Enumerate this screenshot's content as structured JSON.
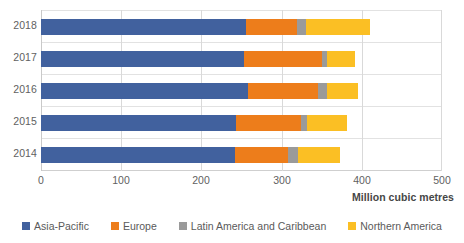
{
  "chart_data": {
    "type": "bar",
    "orientation": "horizontal",
    "stacked": true,
    "title": "",
    "subtitle": "",
    "xlabel": "Million cubic metres",
    "ylabel": "",
    "categories": [
      "2018",
      "2017",
      "2016",
      "2015",
      "2014"
    ],
    "xlim": [
      0,
      500
    ],
    "xticks": [
      "0",
      "100",
      "200",
      "300",
      "400",
      "500"
    ],
    "xtick_values": [
      0,
      100,
      200,
      300,
      400,
      500
    ],
    "grid": "vertical",
    "legend_position": "bottom",
    "series": [
      {
        "name": "Asia-Pacific",
        "color": "#41619E",
        "values": [
          256,
          253,
          258,
          243,
          242
        ]
      },
      {
        "name": "Europe",
        "color": "#ED7D1B",
        "values": [
          63,
          97,
          87,
          81,
          66
        ]
      },
      {
        "name": "Latin America and Caribbean",
        "color": "#9A9A9A",
        "values": [
          11,
          7,
          12,
          8,
          12
        ]
      },
      {
        "name": "Northern America",
        "color": "#FBBF24",
        "values": [
          80,
          34,
          38,
          50,
          53
        ]
      }
    ],
    "totals": [
      410,
      391,
      395,
      382,
      373
    ]
  },
  "axis": {
    "x_title": "Million cubic metres"
  },
  "colors": {
    "asia_pacific": "#41619E",
    "europe": "#ED7D1B",
    "latin_america": "#9A9A9A",
    "northern_america": "#FBBF24",
    "gridline": "#d9d9d9",
    "text": "#595959",
    "background": "#ffffff"
  }
}
